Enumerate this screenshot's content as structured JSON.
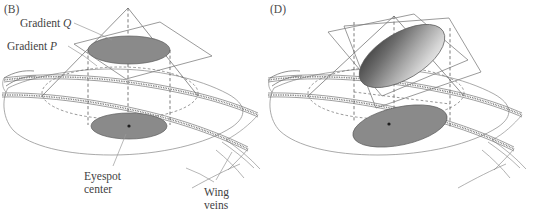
{
  "figure": {
    "background_color": "#ffffff",
    "width": 535,
    "height": 218,
    "line_color": "#6e6e6e",
    "spot_fill": "#8a8a8a",
    "spot_fill_dark": "#4f4f4f",
    "spot_fill_light": "#e3e3e3",
    "text_color": "#3f3f3f"
  },
  "panels": [
    {
      "id": "panel-b",
      "label": "(B)",
      "description": "Symmetric cone gradient intersected by a horizontal plane producing a circular eyespot on the wing",
      "cone": {
        "apex_shape": "point",
        "section_plane": "horizontal",
        "spot_shape": "circle",
        "shading": "uniform"
      },
      "callouts": [
        {
          "id": "gradient-q",
          "text_plain": "Gradient Q",
          "word": "Gradient",
          "symbol": "Q",
          "symbol_style": "italic"
        },
        {
          "id": "gradient-p",
          "text_plain": "Gradient P",
          "word": "Gradient",
          "symbol": "P",
          "symbol_style": "italic"
        },
        {
          "id": "eyespot-center",
          "line1": "Eyespot",
          "line2": "center"
        },
        {
          "id": "wing-veins",
          "line1": "Wing",
          "line2": "veins"
        }
      ]
    },
    {
      "id": "panel-d",
      "label": "(D)",
      "description": "Tilted section plane through the cone producing an elongated, gradient-shaded eyespot on the wing",
      "cone": {
        "apex_shape": "point",
        "section_plane": "tilted",
        "spot_shape": "ellipse",
        "shading": "graded-dark-to-light"
      },
      "callouts": []
    }
  ]
}
